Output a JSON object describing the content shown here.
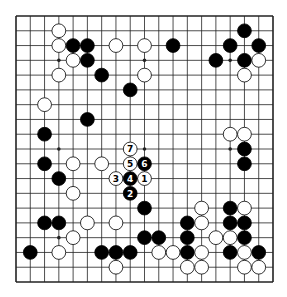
{
  "board": {
    "size": 19,
    "colors": {
      "line": "#222222",
      "black": "#000000",
      "white": "#ffffff",
      "background": "#ffffff"
    },
    "star_points": [
      [
        3,
        3
      ],
      [
        9,
        3
      ],
      [
        15,
        3
      ],
      [
        3,
        9
      ],
      [
        9,
        9
      ],
      [
        15,
        9
      ],
      [
        3,
        15
      ],
      [
        9,
        15
      ],
      [
        15,
        15
      ]
    ],
    "black_stones": [
      [
        16,
        1
      ],
      [
        15,
        2
      ],
      [
        17,
        2
      ],
      [
        14,
        3
      ],
      [
        16,
        3
      ],
      [
        4,
        2
      ],
      [
        5,
        2
      ],
      [
        5,
        3
      ],
      [
        6,
        4
      ],
      [
        11,
        2
      ],
      [
        8,
        5
      ],
      [
        5,
        7
      ],
      [
        2,
        8
      ],
      [
        16,
        9
      ],
      [
        16,
        10
      ],
      [
        2,
        10
      ],
      [
        3,
        11
      ],
      [
        9,
        13
      ],
      [
        2,
        14
      ],
      [
        3,
        14
      ],
      [
        1,
        16
      ],
      [
        6,
        16
      ],
      [
        7,
        16
      ],
      [
        8,
        16
      ],
      [
        9,
        15
      ],
      [
        10,
        15
      ],
      [
        12,
        14
      ],
      [
        12,
        15
      ],
      [
        12,
        16
      ],
      [
        15,
        13
      ],
      [
        15,
        14
      ],
      [
        16,
        14
      ],
      [
        16,
        15
      ],
      [
        15,
        16
      ],
      [
        17,
        16
      ]
    ],
    "white_stones": [
      [
        17,
        3
      ],
      [
        16,
        4
      ],
      [
        3,
        1
      ],
      [
        3,
        2
      ],
      [
        4,
        3
      ],
      [
        3,
        4
      ],
      [
        7,
        2
      ],
      [
        9,
        2
      ],
      [
        9,
        4
      ],
      [
        2,
        6
      ],
      [
        15,
        8
      ],
      [
        16,
        8
      ],
      [
        6,
        10
      ],
      [
        4,
        10
      ],
      [
        4,
        12
      ],
      [
        5,
        14
      ],
      [
        4,
        15
      ],
      [
        3,
        16
      ],
      [
        7,
        14
      ],
      [
        7,
        17
      ],
      [
        10,
        16
      ],
      [
        11,
        16
      ],
      [
        13,
        13
      ],
      [
        16,
        13
      ],
      [
        13,
        14
      ],
      [
        14,
        15
      ],
      [
        15,
        15
      ],
      [
        13,
        16
      ],
      [
        16,
        16
      ],
      [
        12,
        17
      ],
      [
        13,
        17
      ],
      [
        16,
        17
      ],
      [
        17,
        17
      ]
    ],
    "numbered_moves": [
      {
        "label": "1",
        "color": "white",
        "point": [
          9,
          11
        ]
      },
      {
        "label": "2",
        "color": "black",
        "point": [
          8,
          12
        ]
      },
      {
        "label": "3",
        "color": "white",
        "point": [
          7,
          11
        ]
      },
      {
        "label": "4",
        "color": "black",
        "point": [
          8,
          11
        ]
      },
      {
        "label": "5",
        "color": "white",
        "point": [
          8,
          10
        ]
      },
      {
        "label": "6",
        "color": "black",
        "point": [
          9,
          10
        ]
      },
      {
        "label": "7",
        "color": "white",
        "point": [
          8,
          9
        ]
      }
    ]
  }
}
